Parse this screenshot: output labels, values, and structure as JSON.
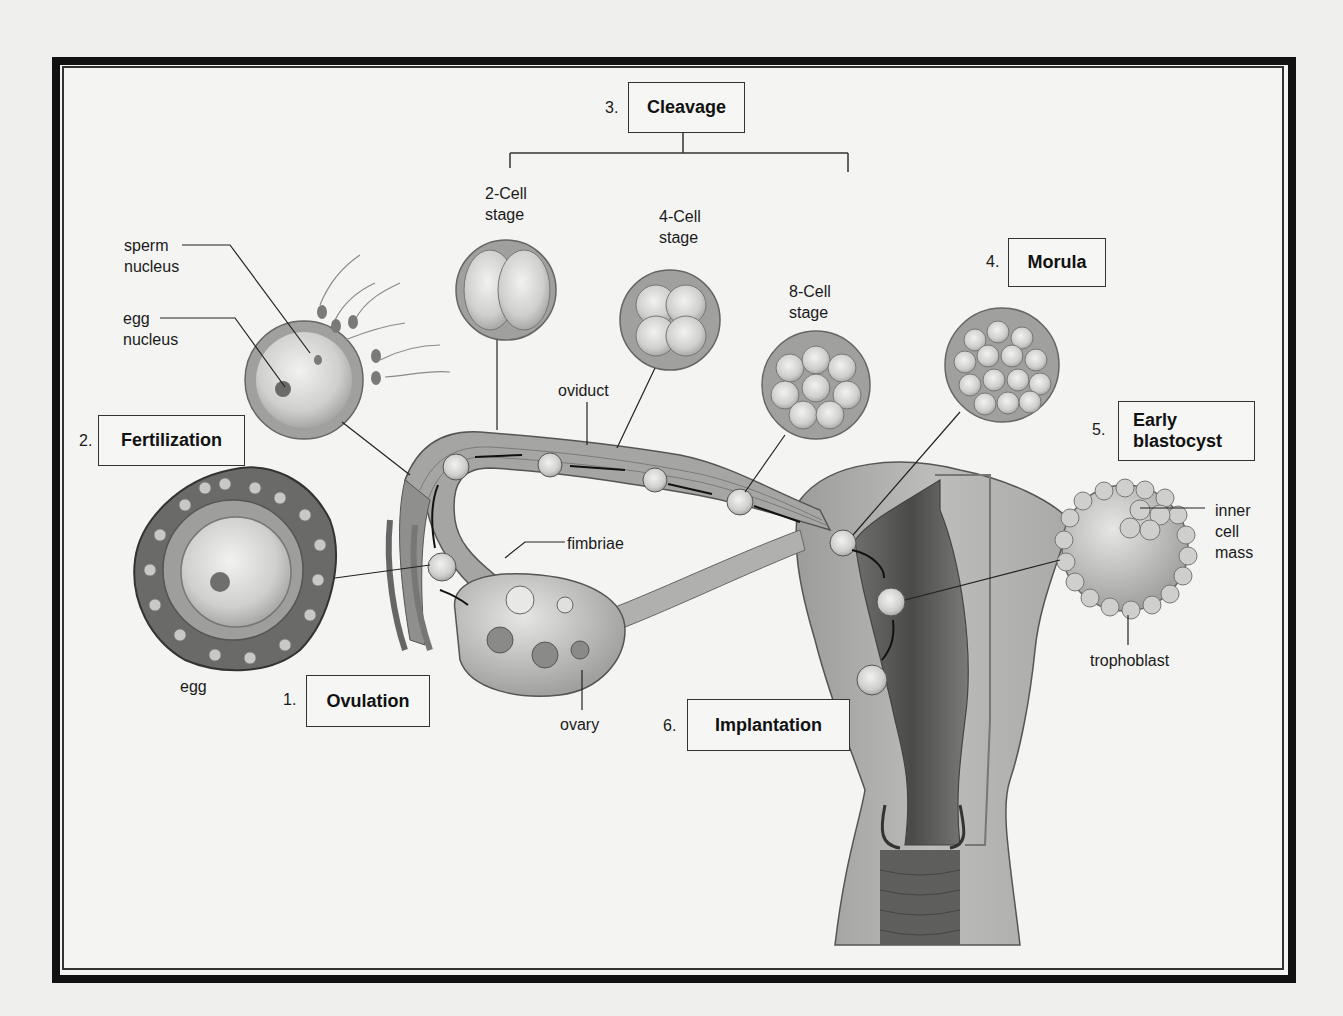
{
  "diagram": {
    "steps": [
      {
        "number": "1.",
        "label": "Ovulation"
      },
      {
        "number": "2.",
        "label": "Fertilization"
      },
      {
        "number": "3.",
        "label": "Cleavage"
      },
      {
        "number": "4.",
        "label": "Morula"
      },
      {
        "number": "5.",
        "label": "Early\nblastocyst",
        "label_line1": "Early",
        "label_line2": "blastocyst"
      },
      {
        "number": "6.",
        "label": "Implantation"
      }
    ],
    "cleavage_stages": [
      {
        "line1": "2-Cell",
        "line2": "stage"
      },
      {
        "line1": "4-Cell",
        "line2": "stage"
      },
      {
        "line1": "8-Cell",
        "line2": "stage"
      }
    ],
    "anatomy_labels": {
      "sperm_nucleus_1": "sperm",
      "sperm_nucleus_2": "nucleus",
      "egg_nucleus_1": "egg",
      "egg_nucleus_2": "nucleus",
      "egg": "egg",
      "oviduct": "oviduct",
      "fimbriae": "fimbriae",
      "ovary": "ovary",
      "inner_cell_mass_1": "inner",
      "inner_cell_mass_2": "cell",
      "inner_cell_mass_3": "mass",
      "trophoblast": "trophoblast"
    },
    "colors": {
      "background": "#efefed",
      "frame": "#111111",
      "tissue_light": "#c8c8c6",
      "tissue_mid": "#9a9a98",
      "tissue_dark": "#5a5a58"
    }
  }
}
